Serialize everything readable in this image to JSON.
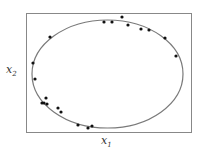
{
  "chart_data": {
    "type": "scatter",
    "title": "",
    "xlabel": "x1",
    "ylabel": "x2",
    "grid": false,
    "ticks": false,
    "frame": {
      "x": 26,
      "y": 13,
      "w": 165,
      "h": 119
    },
    "ellipse": {
      "cx": 107.5,
      "cy": 74,
      "rx": 75.5,
      "ry": 54,
      "stroke": "#7a7a7a"
    },
    "points": [
      [
        50,
        37
      ],
      [
        104,
        22
      ],
      [
        112,
        22
      ],
      [
        122,
        17
      ],
      [
        128,
        25
      ],
      [
        141,
        29
      ],
      [
        149,
        30
      ],
      [
        165,
        38
      ],
      [
        176,
        56
      ],
      [
        33,
        63
      ],
      [
        35,
        79
      ],
      [
        46,
        98
      ],
      [
        42,
        103
      ],
      [
        44,
        103
      ],
      [
        47,
        104
      ],
      [
        58,
        108
      ],
      [
        61,
        112
      ],
      [
        78,
        125
      ],
      [
        88,
        128
      ],
      [
        92,
        126
      ]
    ],
    "point_color": "#111111"
  },
  "labels": {
    "x_main": "x",
    "x_sub": "1",
    "y_main": "x",
    "y_sub": "2"
  }
}
